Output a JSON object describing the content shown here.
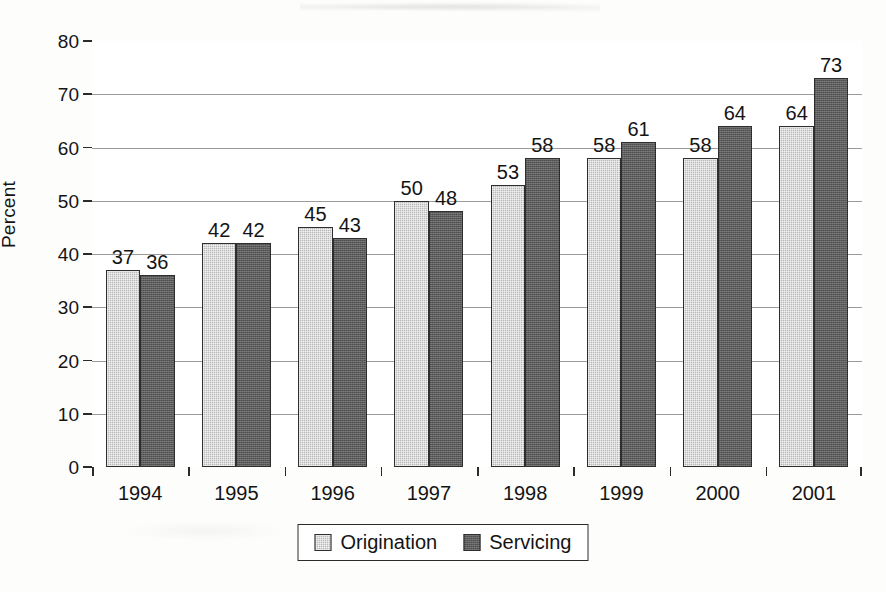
{
  "chart_data": {
    "type": "bar",
    "title": "",
    "subtitle": "",
    "xlabel": "",
    "ylabel": "Percent",
    "categories": [
      "1994",
      "1995",
      "1996",
      "1997",
      "1998",
      "1999",
      "2000",
      "2001"
    ],
    "series": [
      {
        "name": "Origination",
        "color": "#b9b9b9",
        "values": [
          37,
          42,
          45,
          50,
          53,
          58,
          58,
          64
        ]
      },
      {
        "name": "Servicing",
        "color": "#5d5d5d",
        "values": [
          36,
          42,
          43,
          48,
          58,
          61,
          64,
          73
        ]
      }
    ],
    "ylim": [
      0,
      80
    ],
    "ytick_step": 10,
    "yticks": [
      0,
      10,
      20,
      30,
      40,
      50,
      60,
      70,
      80
    ],
    "ytick_labels": [
      "0",
      "10",
      "20",
      "30",
      "40",
      "50",
      "60",
      "70",
      "80"
    ],
    "grid": true,
    "grid_axis": "y",
    "data_labels": true,
    "legend": true,
    "legend_position": "bottom",
    "bar_border_color": "#2e2e2e",
    "axis_color": "#2b2b2b",
    "grid_color": "#9b9b9b",
    "background": "#ffffff"
  },
  "legend": {
    "entries": [
      {
        "label": "Origination"
      },
      {
        "label": "Servicing"
      }
    ]
  }
}
